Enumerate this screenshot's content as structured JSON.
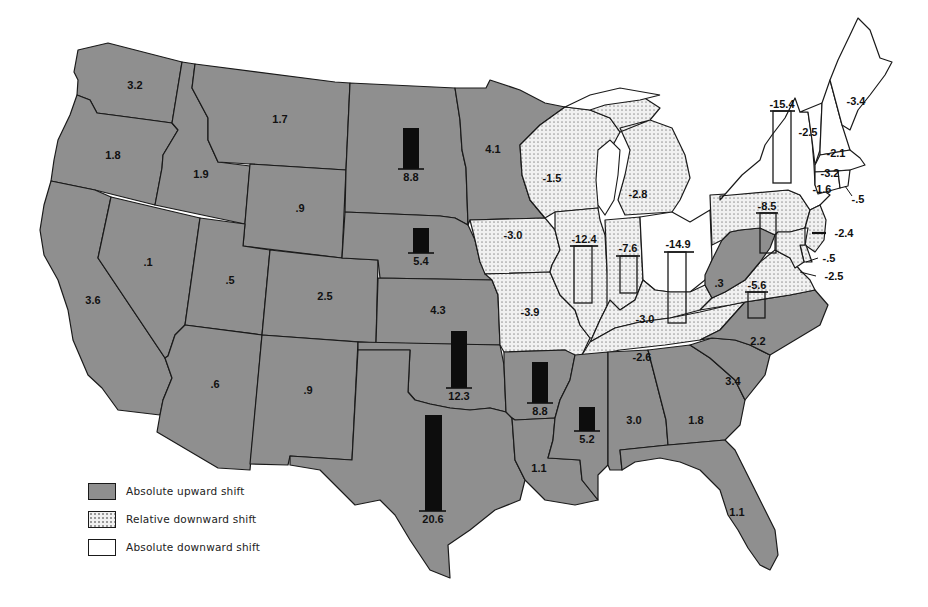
{
  "legend": {
    "items": [
      {
        "key": "up",
        "label": "Absolute upward shift"
      },
      {
        "key": "rel",
        "label": "Relative downward shift"
      },
      {
        "key": "abs",
        "label": "Absolute downward shift"
      }
    ]
  },
  "colors": {
    "absolute_upward_fill": "#8f8f8f",
    "relative_downward_fill": "dotted #f1f1f1",
    "absolute_downward_fill": "#ffffff",
    "bar_fill": "#0d0d0d",
    "outline": "#1a1a1a"
  },
  "states": {
    "WA": {
      "value": "3.2",
      "category": "up"
    },
    "OR": {
      "value": "1.8",
      "category": "up"
    },
    "CA": {
      "value": "3.6",
      "category": "up"
    },
    "ID": {
      "value": "1.9",
      "category": "up"
    },
    "NV": {
      "value": ".1",
      "category": "up"
    },
    "MT": {
      "value": "1.7",
      "category": "up"
    },
    "WY": {
      "value": ".9",
      "category": "up"
    },
    "UT": {
      "value": ".5",
      "category": "up"
    },
    "CO": {
      "value": "2.5",
      "category": "up"
    },
    "AZ": {
      "value": ".6",
      "category": "up"
    },
    "NM": {
      "value": ".9",
      "category": "up"
    },
    "DAKOTAS": {
      "value": "8.8",
      "category": "up",
      "bar": true
    },
    "NE": {
      "value": "5.4",
      "category": "up",
      "bar": true
    },
    "KS": {
      "value": "4.3",
      "category": "up"
    },
    "OK": {
      "value": "12.3",
      "category": "up",
      "bar": true
    },
    "TX": {
      "value": "20.6",
      "category": "up",
      "bar": true
    },
    "MN": {
      "value": "4.1",
      "category": "up"
    },
    "IA": {
      "value": "-3.0",
      "category": "rel"
    },
    "MO": {
      "value": "-3.9",
      "category": "rel"
    },
    "AR": {
      "value": "8.8",
      "category": "up",
      "bar": true
    },
    "LA": {
      "value": "1.1",
      "category": "up"
    },
    "WI": {
      "value": "-1.5",
      "category": "rel"
    },
    "IL": {
      "value": "-12.4",
      "category": "rel",
      "bar": true
    },
    "MI": {
      "value": "-2.8",
      "category": "rel"
    },
    "IN": {
      "value": "-7.6",
      "category": "rel",
      "bar": true
    },
    "OH": {
      "value": "-14.9",
      "category": "abs",
      "bar": true
    },
    "KY": {
      "value": "-3.0",
      "category": "rel"
    },
    "TN": {
      "value": "-2.6",
      "category": "rel"
    },
    "MS": {
      "value": "5.2",
      "category": "up",
      "bar": true
    },
    "AL": {
      "value": "3.0",
      "category": "up"
    },
    "GA": {
      "value": "1.8",
      "category": "up"
    },
    "FL": {
      "value": "1.1",
      "category": "up"
    },
    "SC": {
      "value": "3.4",
      "category": "up"
    },
    "NC": {
      "value": "2.2",
      "category": "up"
    },
    "VA": {
      "value": "-5.6",
      "category": "rel",
      "bar": true
    },
    "WV": {
      "value": ".3",
      "category": "up"
    },
    "PA": {
      "value": "-8.5",
      "category": "rel",
      "bar": true
    },
    "NY": {
      "value": "-15.4",
      "category": "abs",
      "bar": true
    },
    "VT": {
      "value": "-2.5",
      "category": "abs"
    },
    "NH": {
      "value": "-2.1",
      "category": "abs"
    },
    "ME": {
      "value": "-3.4",
      "category": "abs"
    },
    "MA": {
      "value": "-3.2",
      "category": "abs"
    },
    "CT": {
      "value": "-1.6",
      "category": "abs"
    },
    "RI": {
      "value": "-.5",
      "category": "abs"
    },
    "NJ": {
      "value": "-2.4",
      "category": "rel"
    },
    "DE": {
      "value": "-.5",
      "category": "rel"
    },
    "MD": {
      "value": "-2.5",
      "category": "rel"
    }
  }
}
